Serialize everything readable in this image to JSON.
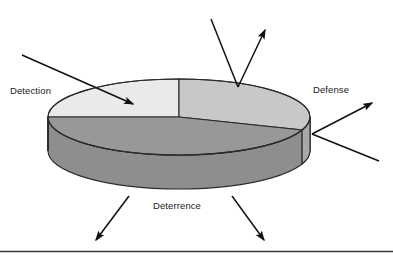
{
  "figure": {
    "title": "",
    "background_color": "#ffffff",
    "bottom_rule_color": "#3b3b3b"
  },
  "diagram": {
    "type": "3d-pie-chart",
    "shape": "cylinder-disk",
    "center": {
      "x": 179,
      "y": 117
    },
    "radius_x": 131,
    "radius_y": 38,
    "depth": 34,
    "outline_color": "#2b2b2b",
    "segments": [
      {
        "id": "detection",
        "label": "Detection",
        "top_color": "#eaeaea",
        "side_color": "#c3c3c3",
        "position": "upper-left",
        "start_angle_deg": 180,
        "end_angle_deg": 270
      },
      {
        "id": "defense",
        "label": "Defense",
        "top_color": "#c8c8c8",
        "side_color": "#a8a8a8",
        "position": "upper-right",
        "start_angle_deg": 270,
        "end_angle_deg": 20
      },
      {
        "id": "deterrence",
        "label": "Deterrence",
        "top_color": "#989898",
        "side_color": "#8e8e8e",
        "position": "front-bottom",
        "start_angle_deg": 20,
        "end_angle_deg": 180
      }
    ],
    "arrows": [
      {
        "id": "detection-incoming",
        "points_to": "detection",
        "direction": "down-right",
        "has_head": true,
        "from": {
          "x": 22,
          "y": 55
        },
        "to": {
          "x": 133,
          "y": 104
        }
      },
      {
        "id": "defense-top-incoming",
        "points_to": "defense",
        "direction": "down-right",
        "has_head": false,
        "from": {
          "x": 211,
          "y": 19
        },
        "to": {
          "x": 238,
          "y": 87
        }
      },
      {
        "id": "defense-top-outgoing",
        "points_to": "defense",
        "direction": "up-right",
        "has_head": true,
        "from": {
          "x": 238,
          "y": 87
        },
        "to": {
          "x": 265,
          "y": 30
        }
      },
      {
        "id": "defense-side-outgoing",
        "points_to": "defense",
        "direction": "up-right",
        "has_head": true,
        "from": {
          "x": 312,
          "y": 134
        },
        "to": {
          "x": 372,
          "y": 103
        }
      },
      {
        "id": "defense-side-incoming",
        "points_to": "defense",
        "direction": "down-right",
        "has_head": false,
        "from": {
          "x": 312,
          "y": 134
        },
        "to": {
          "x": 379,
          "y": 161
        }
      },
      {
        "id": "deterrence-left-outgoing",
        "points_to": "deterrence",
        "direction": "down-left",
        "has_head": true,
        "from": {
          "x": 129,
          "y": 196
        },
        "to": {
          "x": 96,
          "y": 240
        }
      },
      {
        "id": "deterrence-right-outgoing",
        "points_to": "deterrence",
        "direction": "down-right",
        "has_head": true,
        "from": {
          "x": 232,
          "y": 196
        },
        "to": {
          "x": 264,
          "y": 240
        }
      }
    ]
  },
  "labels": {
    "detection": "Detection",
    "defense": "Defense",
    "deterrence": "Deterrence"
  }
}
